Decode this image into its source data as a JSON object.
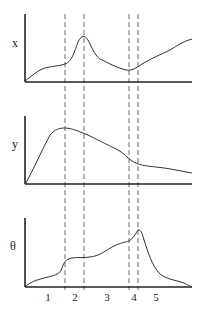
{
  "figure": {
    "panels": [
      {
        "id": "x",
        "label": "x"
      },
      {
        "id": "y",
        "label": "y"
      },
      {
        "id": "theta",
        "label": "θ"
      }
    ],
    "regions": [
      "1",
      "2",
      "3",
      "4",
      "5"
    ],
    "dashed_line_count": 4
  }
}
